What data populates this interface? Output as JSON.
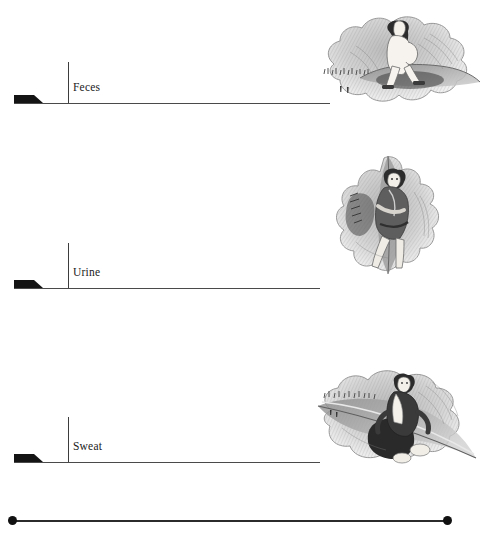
{
  "figure": {
    "title": "",
    "background_color": "#ffffff",
    "ink_color": "#1a1a1a",
    "line_color": "#4a4a4a",
    "marker_color": "#141414"
  },
  "rows": [
    {
      "label": "Feces",
      "baseline_y": 103,
      "baseline_x": 14,
      "baseline_width": 316,
      "tick_x": 68,
      "tick_y": 62,
      "tick_height": 41,
      "label_x": 73,
      "label_y": 88,
      "wedge_x": 14,
      "wedge_width": 20,
      "wedge_height": 8,
      "illustration": "person-squatting-on-leaf-sketch"
    },
    {
      "label": "Urine",
      "baseline_y": 288,
      "baseline_x": 14,
      "baseline_width": 306,
      "tick_x": 68,
      "tick_y": 243,
      "tick_height": 45,
      "label_x": 73,
      "label_y": 273,
      "wedge_x": 14,
      "wedge_width": 20,
      "wedge_height": 8,
      "illustration": "person-seated-on-leaf-sketch"
    },
    {
      "label": "Sweat",
      "baseline_y": 462,
      "baseline_x": 14,
      "baseline_width": 306,
      "tick_x": 68,
      "tick_y": 417,
      "tick_height": 45,
      "label_x": 73,
      "label_y": 447,
      "wedge_x": 14,
      "wedge_width": 20,
      "wedge_height": 8,
      "illustration": "person-reclining-on-leaf-sketch"
    }
  ],
  "axis": {
    "name": "bottom-scale-axis",
    "x": 6,
    "y": 512,
    "width": 448,
    "height": 16,
    "endpoint_left": "filled-dot",
    "endpoint_right": "filled-dot",
    "left_label": "",
    "right_label": ""
  },
  "illustrations": [
    {
      "name": "person-squatting-on-leaf-sketch",
      "x": 300,
      "y": 8,
      "width": 186,
      "height": 108,
      "style": "graphite-pencil-sketch"
    },
    {
      "name": "person-seated-on-leaf-sketch",
      "x": 326,
      "y": 152,
      "width": 140,
      "height": 130,
      "style": "graphite-pencil-sketch"
    },
    {
      "name": "person-reclining-on-leaf-sketch",
      "x": 298,
      "y": 362,
      "width": 188,
      "height": 122,
      "style": "graphite-pencil-sketch"
    }
  ]
}
